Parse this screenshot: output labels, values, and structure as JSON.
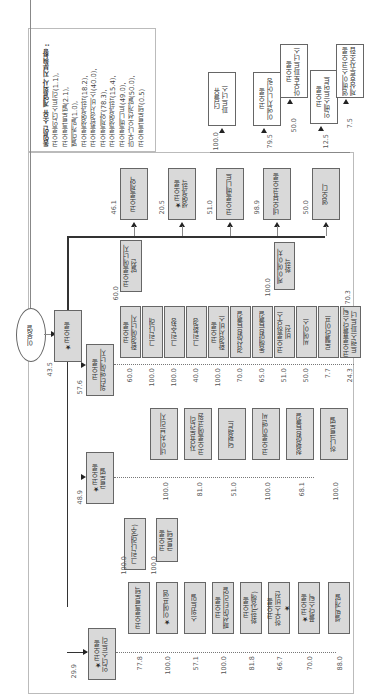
{
  "legend": {
    "title": "동일인 소유 계열회사 지분현황 :",
    "items": [
      "코오롱인더스트리(1.1),",
      "코오롱글로벌(2.1),",
      "별레캐빌(1.0),",
      "코오롱생명과학(18.2),",
      "코오롱환경서비스(40.0),",
      "코오롱제약(78.3),",
      "코오롱생명과학(15.4),",
      "코오롱베니트(49.0),",
      "마우나오션개발(50.0),",
      "코오롱글로텍(0.5)"
    ]
  },
  "owner": {
    "name": "이웅열",
    "stake_in_kolon": "43.5"
  },
  "hub": {
    "name": "★코오롱"
  },
  "top_row": [
    {
      "name": "코오롱제약",
      "pct": "46.1"
    },
    {
      "name": "★코오롱\n생명과학",
      "pct": "20.5"
    },
    {
      "name": "코오롱베니트",
      "pct": "51.0"
    },
    {
      "name": "네오뷰코오롱",
      "pct": "98.9"
    },
    {
      "name": "엠오디",
      "pct": "50.0"
    }
  ],
  "top_right": [
    {
      "name": "더블유\n파트너스",
      "pct": "100.0"
    },
    {
      "name": "코오롱\n이엔지니어링",
      "pct": "79.5"
    },
    {
      "name": "코오롱\n아우토파트너스",
      "pct": "50.0"
    },
    {
      "name": "코오롱\n인베스트먼트",
      "pct": "12.5"
    },
    {
      "name": "엠베이스코오롱\n제삼호투자조합",
      "pct": "7.5"
    }
  ],
  "water": {
    "name": "코오롱\n워터앤에너지",
    "pct": "57.6",
    "ecoone": {
      "name": "코오롱에코원",
      "pct": "60.0"
    },
    "energy": {
      "name": "코오롱에너지\n발전",
      "pct": "60.0"
    },
    "children": [
      {
        "name": "코오롱\n환경에너지",
        "pct": "60.0"
      },
      {
        "name": "그린나래",
        "pct": "100.0"
      },
      {
        "name": "그린순창",
        "pct": "100.0"
      },
      {
        "name": "그린환경",
        "pct": "40.0"
      },
      {
        "name": "코오롱\n환경서비스",
        "pct": "100.0"
      },
      {
        "name": "경산맑은물길",
        "pct": "70.0"
      },
      {
        "name": "동해맑은물길",
        "pct": "65.0"
      },
      {
        "name": "코오롱하우스\n비전",
        "pct": "51.0"
      },
      {
        "name": "씨에이스",
        "pct": "50.0"
      },
      {
        "name": "로웰라이프",
        "pct": "7.7"
      },
      {
        "name": "코오롱플라스틱\n트랜스파트너",
        "pct": "24.3"
      }
    ],
    "housevision_child": {
      "name": "케이에이치\n화학",
      "pct": "100.0"
    },
    "last_child_extra_pct": "70.3"
  },
  "global": {
    "name": "★코오롱\n글로벌",
    "pct": "48.9",
    "children": [
      {
        "name": "네이처브리지",
        "pct": "100.0"
      },
      {
        "name": "자유로관리\n코오롱에코원",
        "pct": "81.0"
      },
      {
        "name": "덕평랜드",
        "pct": "51.0"
      },
      {
        "name": "코오롱이앤씨",
        "pct": "100.0"
      },
      {
        "name": "청평맑은물길",
        "pct": "68.1"
      },
      {
        "name": "하나글로벌",
        "pct": "100.0"
      }
    ]
  },
  "industry": {
    "name": "★코오롱\n인더스트리",
    "pct": "29.9",
    "children": [
      {
        "name": "코오롱글로텍",
        "pct": "77.8"
      },
      {
        "name": "★이에프엠",
        "pct": "100.0"
      },
      {
        "name": "스위트밀",
        "pct": "57.1"
      },
      {
        "name": "코오롱\n패션머티리얼",
        "pct": "100.0"
      },
      {
        "name": "코오롱\n화학(상해)",
        "pct": "81.8"
      },
      {
        "name": "코오롱\n하우스비전\n★",
        "pct": "66.7"
      },
      {
        "name": "★코오롱\n플라스틱",
        "pct": "70.0"
      },
      {
        "name": "셀빅개발",
        "pct": "88.0"
      }
    ],
    "glotech_children": [
      {
        "name": "그린나래(주)",
        "pct": "100.0"
      },
      {
        "name": "코오롱\n글로텍",
        "pct": "100.0"
      }
    ]
  }
}
